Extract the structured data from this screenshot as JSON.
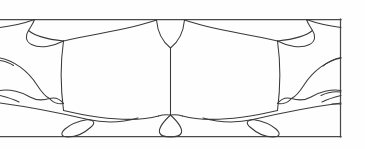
{
  "artwork": {
    "title": "Stained Glass Transom Panel",
    "type": "line-drawing",
    "description": "Bilaterally symmetric leaded glass panel pattern in a horizontal rectangular frame",
    "orientation": "horizontal",
    "symmetry": "bilateral-vertical-axis",
    "canvas": {
      "width": 365,
      "height": 149
    },
    "colors": {
      "background": "#fefefe",
      "line": "#3a3a3c",
      "frame_line": "#4a4a4c",
      "glass_fill": "#fefefe"
    },
    "frame": {
      "top_y": 19,
      "bottom_y": 137,
      "right_x": 341,
      "left_x": 0,
      "note": "design bleeds off the left edge; right vertical border is drawn"
    },
    "elements": [
      {
        "name": "top-border",
        "kind": "frame-line",
        "count": 1
      },
      {
        "name": "bottom-border",
        "kind": "frame-line",
        "count": 1
      },
      {
        "name": "right-border",
        "kind": "frame-line",
        "count": 1
      },
      {
        "name": "center-mullion",
        "kind": "vertical-line",
        "count": 1
      },
      {
        "name": "keystone-diamond",
        "kind": "glass-piece",
        "count": 1
      },
      {
        "name": "center-teardrop",
        "kind": "glass-piece",
        "count": 1
      },
      {
        "name": "main-body-panel",
        "kind": "glass-piece",
        "count": 2
      },
      {
        "name": "upper-corner-leaf",
        "kind": "glass-piece",
        "count": 2
      },
      {
        "name": "side-bird-wing",
        "kind": "glass-piece",
        "count": 2
      },
      {
        "name": "lower-corner-petal",
        "kind": "glass-piece",
        "count": 2
      },
      {
        "name": "corner-filler-wedge",
        "kind": "glass-piece",
        "count": 4
      }
    ]
  }
}
